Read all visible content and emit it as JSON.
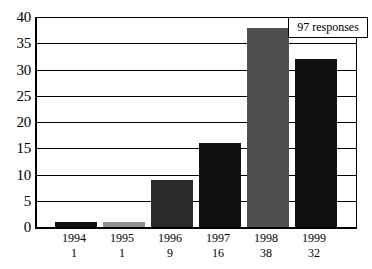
{
  "chart_data": {
    "type": "bar",
    "title": "",
    "subtitle": "",
    "xlabel": "",
    "ylabel": "",
    "categories": [
      "1994",
      "1995",
      "1996",
      "1997",
      "1998",
      "1999"
    ],
    "values": [
      1,
      1,
      9,
      16,
      38,
      32
    ],
    "value_labels": [
      "1",
      "1",
      "9",
      "16",
      "38",
      "32"
    ],
    "series": [
      {
        "name": "responses",
        "values": [
          1,
          1,
          9,
          16,
          38,
          32
        ]
      }
    ],
    "bar_colors": [
      "#101010",
      "#909090",
      "#2a2a2a",
      "#101010",
      "#4f4f4f",
      "#101010"
    ],
    "ylim": [
      0,
      40
    ],
    "yticks": [
      0,
      5,
      10,
      15,
      20,
      25,
      30,
      35,
      40
    ],
    "ytick_labels": [
      "0",
      "5",
      "10",
      "15",
      "20",
      "25",
      "30",
      "35",
      "40"
    ],
    "grid": true,
    "legend": false,
    "legend_position": "none",
    "annotations": [
      {
        "text": "97 responses",
        "position": "top-right"
      }
    ]
  },
  "annotation": {
    "responses_text": "97 responses"
  },
  "colors": {
    "axis": "#000000",
    "grid": "#000000",
    "background": "#ffffff",
    "bar_black": "#101010",
    "bar_gray": "#909090",
    "bar_dark_gray": "#4f4f4f"
  }
}
